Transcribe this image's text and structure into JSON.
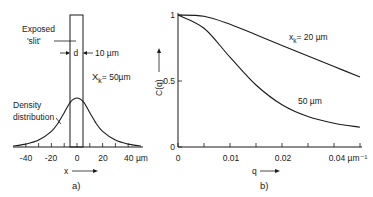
{
  "chart_data": [
    {
      "panel": "a)",
      "type": "line",
      "title": "",
      "xlabel": "x",
      "ylabel": "",
      "xlim": [
        -50,
        50
      ],
      "x_ticks": [
        -40,
        -30,
        -20,
        -10,
        0,
        10,
        20,
        30,
        40
      ],
      "x_tick_labels": [
        "-40",
        "-20",
        "0",
        "20",
        "40 µm"
      ],
      "annotations": {
        "slit_label_1": "Exposed",
        "slit_label_2": "'slit'",
        "width_symbol": "d",
        "width_value": "10 µm",
        "xk_label": "X",
        "xk_sub": "k",
        "xk_value": "= 50µm",
        "density_label_1": "Density",
        "density_label_2": "distribution"
      },
      "slit": {
        "x_start": -5,
        "x_end": 5,
        "height": 1.0
      },
      "series": [
        {
          "name": "Density distribution",
          "x": [
            -50,
            -40,
            -30,
            -20,
            -15,
            -10,
            -5,
            0,
            5,
            10,
            15,
            20,
            30,
            40,
            50
          ],
          "values": [
            0.01,
            0.03,
            0.07,
            0.16,
            0.24,
            0.35,
            0.46,
            0.5,
            0.46,
            0.35,
            0.24,
            0.16,
            0.07,
            0.03,
            0.01
          ]
        }
      ]
    },
    {
      "panel": "b)",
      "type": "line",
      "title": "",
      "xlabel": "q",
      "ylabel": "C(q)",
      "xlim": [
        0,
        0.035
      ],
      "ylim": [
        0,
        1
      ],
      "x_ticks": [
        0,
        0.005,
        0.01,
        0.015,
        0.02,
        0.025,
        0.03,
        0.035
      ],
      "x_tick_labels": [
        "0",
        "0.01",
        "0.02",
        "0.04 µm⁻¹"
      ],
      "y_ticks": [
        0,
        0.5,
        1
      ],
      "y_tick_labels": [
        "0",
        "0.5",
        "1"
      ],
      "series": [
        {
          "name": "x_k = 20 µm",
          "x": [
            0,
            0.005,
            0.01,
            0.015,
            0.02,
            0.025,
            0.03,
            0.035
          ],
          "values": [
            1.0,
            0.99,
            0.93,
            0.85,
            0.77,
            0.69,
            0.61,
            0.53
          ]
        },
        {
          "name": "50 µm",
          "x": [
            0,
            0.005,
            0.01,
            0.015,
            0.02,
            0.025,
            0.03,
            0.035
          ],
          "values": [
            1.0,
            0.9,
            0.68,
            0.47,
            0.32,
            0.23,
            0.18,
            0.15
          ]
        }
      ]
    }
  ],
  "labels": {
    "panel_a": "a)",
    "panel_b": "b)",
    "a_xlabel": "x",
    "b_xlabel": "q",
    "b_ylabel": "C(q)",
    "b_series1_name": "x",
    "b_series1_sub": "k",
    "b_series1_value": "= 20 µm",
    "b_series2_name": "50 µm"
  }
}
